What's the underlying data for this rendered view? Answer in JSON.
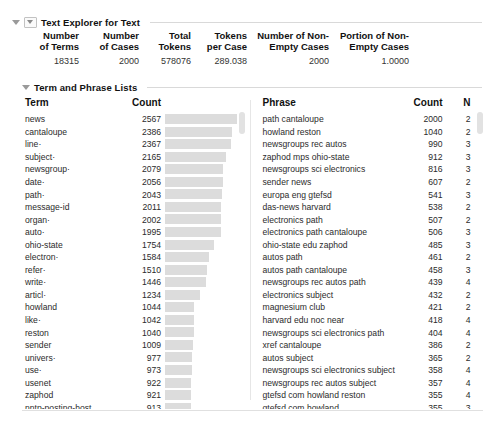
{
  "window": {
    "title": "Text Explorer for Text"
  },
  "outline": {
    "root_label": "Text Explorer for Text",
    "section_label": "Term and Phrase Lists",
    "root_triangle_icon": "disclosure-triangle-icon",
    "section_triangle_icon": "disclosure-triangle-icon"
  },
  "summary": {
    "headers": [
      "Number of Terms",
      "Number of Cases",
      "Total Tokens",
      "Tokens per Case",
      "Number of Non-Empty Cases",
      "Portion of Non-Empty Cases"
    ],
    "header_lines": [
      [
        "Number",
        "of Terms"
      ],
      [
        "Number",
        "of Cases"
      ],
      [
        "Total",
        "Tokens"
      ],
      [
        "Tokens",
        "per Case"
      ],
      [
        "Number of Non-",
        "Empty Cases"
      ],
      [
        "Portion of Non-",
        "Empty Cases"
      ]
    ],
    "values": [
      "18315",
      "2000",
      "578076",
      "289.038",
      "2000",
      "1.0000"
    ]
  },
  "term_list": {
    "columns": [
      "Term",
      "Count"
    ],
    "bar_max": 2567,
    "rows": [
      {
        "term": "news",
        "count": 2567
      },
      {
        "term": "cantaloupe",
        "count": 2386
      },
      {
        "term": "line·",
        "count": 2367
      },
      {
        "term": "subject·",
        "count": 2165
      },
      {
        "term": "newsgroup·",
        "count": 2079
      },
      {
        "term": "date·",
        "count": 2056
      },
      {
        "term": "path·",
        "count": 2043
      },
      {
        "term": "message-id",
        "count": 2011
      },
      {
        "term": "organ·",
        "count": 2002
      },
      {
        "term": "auto·",
        "count": 1995
      },
      {
        "term": "ohio-state",
        "count": 1754
      },
      {
        "term": "electron·",
        "count": 1584
      },
      {
        "term": "refer·",
        "count": 1510
      },
      {
        "term": "write·",
        "count": 1446
      },
      {
        "term": "articl·",
        "count": 1234
      },
      {
        "term": "howland",
        "count": 1044
      },
      {
        "term": "like·",
        "count": 1042
      },
      {
        "term": "reston",
        "count": 1040
      },
      {
        "term": "sender",
        "count": 1009
      },
      {
        "term": "univers·",
        "count": 977
      },
      {
        "term": "use·",
        "count": 973
      },
      {
        "term": "usenet",
        "count": 922
      },
      {
        "term": "zaphod",
        "count": 921
      },
      {
        "term": "nntp-posting-host",
        "count": 913
      },
      {
        "term": "just",
        "count": 911
      }
    ]
  },
  "phrase_list": {
    "columns": [
      "Phrase",
      "Count",
      "N"
    ],
    "rows": [
      {
        "phrase": "path cantaloupe",
        "count": 2000,
        "n": 2
      },
      {
        "phrase": "howland reston",
        "count": 1040,
        "n": 2
      },
      {
        "phrase": "newsgroups rec autos",
        "count": 990,
        "n": 3
      },
      {
        "phrase": "zaphod mps ohio-state",
        "count": 912,
        "n": 3
      },
      {
        "phrase": "newsgroups sci electronics",
        "count": 816,
        "n": 3
      },
      {
        "phrase": "sender news",
        "count": 607,
        "n": 2
      },
      {
        "phrase": "europa eng gtefsd",
        "count": 541,
        "n": 3
      },
      {
        "phrase": "das-news harvard",
        "count": 538,
        "n": 2
      },
      {
        "phrase": "electronics path",
        "count": 507,
        "n": 2
      },
      {
        "phrase": "electronics path cantaloupe",
        "count": 506,
        "n": 3
      },
      {
        "phrase": "ohio-state edu zaphod",
        "count": 485,
        "n": 3
      },
      {
        "phrase": "autos path",
        "count": 461,
        "n": 2
      },
      {
        "phrase": "autos path cantaloupe",
        "count": 458,
        "n": 3
      },
      {
        "phrase": "newsgroups rec autos path",
        "count": 439,
        "n": 4
      },
      {
        "phrase": "electronics subject",
        "count": 432,
        "n": 2
      },
      {
        "phrase": "magnesium club",
        "count": 421,
        "n": 2
      },
      {
        "phrase": "harvard edu noc near",
        "count": 418,
        "n": 4
      },
      {
        "phrase": "newsgroups sci electronics path",
        "count": 404,
        "n": 4
      },
      {
        "phrase": "xref cantaloupe",
        "count": 386,
        "n": 2
      },
      {
        "phrase": "autos subject",
        "count": 365,
        "n": 2
      },
      {
        "phrase": "newsgroups sci electronics subject",
        "count": 358,
        "n": 4
      },
      {
        "phrase": "newsgroups rec autos subject",
        "count": 357,
        "n": 4
      },
      {
        "phrase": "gtefsd com howland reston",
        "count": 355,
        "n": 4
      },
      {
        "phrase": "gtefsd com howland",
        "count": 355,
        "n": 3
      },
      {
        "phrase": "rochester udel",
        "count": 329,
        "n": 2
      }
    ]
  },
  "colors": {
    "bar_fill": "#dcdcdc",
    "rule": "#d9d9d9",
    "text": "#1a1a1a",
    "scroll_thumb": "#e2e2e2"
  }
}
